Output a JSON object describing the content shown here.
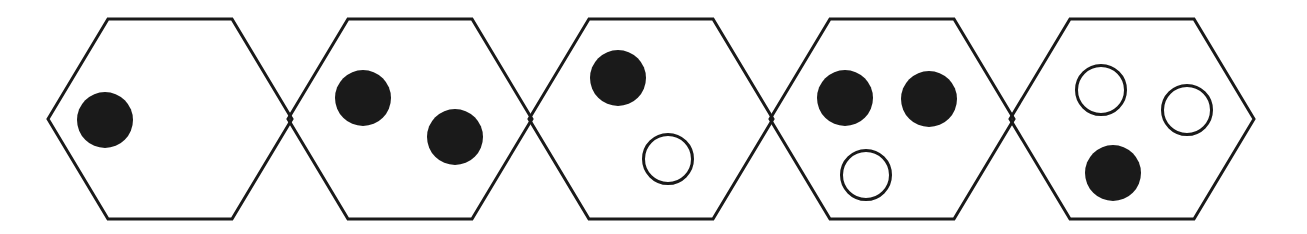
{
  "figure": {
    "title": "",
    "type": "hexagon-cell-sequence",
    "canvas": {
      "width": 1307,
      "height": 234,
      "background": "#ffffff"
    },
    "style": {
      "outline_color": "#1a1a1a",
      "outline_width": 3,
      "filled_dot_color": "#1a1a1a",
      "hollow_dot_stroke": "#1a1a1a",
      "hollow_dot_fill": "#ffffff",
      "hollow_dot_stroke_width": 3
    },
    "geometry": {
      "hex_width": 244,
      "hex_height": 200,
      "hex_top_inset": 60,
      "hex_center_y": 119,
      "hex_step_x": 240.5,
      "first_hex_left_vertex_x": 48
    },
    "cells": [
      {
        "index": 1,
        "name": "hexagon-1",
        "left_vertex_x": 48,
        "filled_count": 1,
        "hollow_count": 0,
        "total_count": 1,
        "dots": [
          {
            "name": "dot-1",
            "kind": "filled",
            "cx": 105,
            "cy": 120,
            "r": 28
          }
        ]
      },
      {
        "index": 2,
        "name": "hexagon-2",
        "left_vertex_x": 288,
        "filled_count": 2,
        "hollow_count": 0,
        "total_count": 2,
        "dots": [
          {
            "name": "dot-1",
            "kind": "filled",
            "cx": 363,
            "cy": 98,
            "r": 28
          },
          {
            "name": "dot-2",
            "kind": "filled",
            "cx": 455,
            "cy": 137,
            "r": 28
          }
        ]
      },
      {
        "index": 3,
        "name": "hexagon-3",
        "left_vertex_x": 529,
        "filled_count": 1,
        "hollow_count": 1,
        "total_count": 2,
        "dots": [
          {
            "name": "dot-1",
            "kind": "filled",
            "cx": 618,
            "cy": 78,
            "r": 28
          },
          {
            "name": "dot-2",
            "kind": "hollow",
            "cx": 668,
            "cy": 159,
            "r": 26
          }
        ]
      },
      {
        "index": 4,
        "name": "hexagon-4",
        "left_vertex_x": 770,
        "filled_count": 2,
        "hollow_count": 1,
        "total_count": 3,
        "dots": [
          {
            "name": "dot-1",
            "kind": "filled",
            "cx": 845,
            "cy": 98,
            "r": 28
          },
          {
            "name": "dot-2",
            "kind": "filled",
            "cx": 929,
            "cy": 99,
            "r": 28
          },
          {
            "name": "dot-3",
            "kind": "hollow",
            "cx": 866,
            "cy": 175,
            "r": 26
          }
        ]
      },
      {
        "index": 5,
        "name": "hexagon-5",
        "left_vertex_x": 1010,
        "filled_count": 1,
        "hollow_count": 2,
        "total_count": 3,
        "dots": [
          {
            "name": "dot-1",
            "kind": "hollow",
            "cx": 1101,
            "cy": 90,
            "r": 26
          },
          {
            "name": "dot-2",
            "kind": "hollow",
            "cx": 1187,
            "cy": 110,
            "r": 26
          },
          {
            "name": "dot-3",
            "kind": "filled",
            "cx": 1113,
            "cy": 173,
            "r": 28
          }
        ]
      }
    ]
  }
}
